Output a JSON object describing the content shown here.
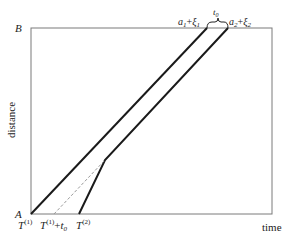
{
  "diagram": {
    "y_axis_label": "distance",
    "x_axis_label": "time",
    "point_top": "B",
    "point_bottom": "A",
    "top_labels": {
      "left": {
        "base": "a",
        "sub": "1",
        "plus": "+",
        "xi": "ξ",
        "xi_sub": "1"
      },
      "gap": {
        "base": "t",
        "sub": "0"
      },
      "right": {
        "base": "a",
        "sub": "2",
        "plus": "+",
        "xi": "ξ",
        "xi_sub": "2"
      }
    },
    "bottom_labels": {
      "t1": {
        "base": "T",
        "sup": "(1)"
      },
      "t1_plus_t0": {
        "base": "T",
        "sup": "(1)",
        "plus": "+",
        "t": "t",
        "t_sub": "0"
      },
      "t2": {
        "base": "T",
        "sup": "(2)"
      }
    },
    "colors": {
      "frame": "#7a7a7a",
      "trajectory": "#1a1a1a",
      "dashed": "#9a9a9a"
    }
  }
}
